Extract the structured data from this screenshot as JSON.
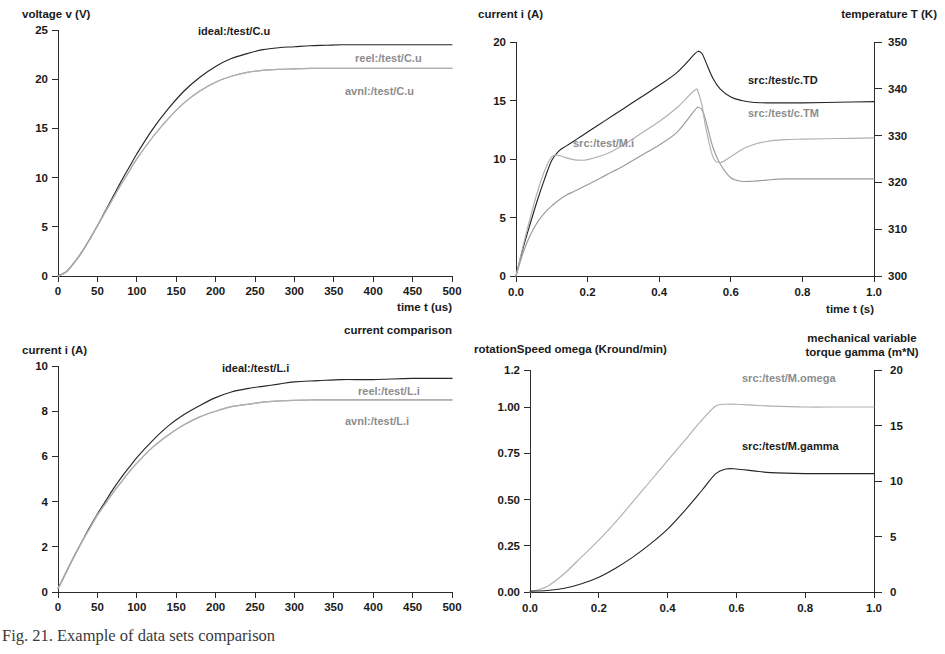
{
  "figure": {
    "caption": "Fig. 21. Example of data sets comparison"
  },
  "panels": {
    "top_left": {
      "name": "capacitor voltage",
      "y_axis_title": "voltage v (V)",
      "x_axis_title": "time t (us)",
      "y_ticks": [
        "0",
        "5",
        "10",
        "15",
        "20",
        "25"
      ],
      "x_ticks": [
        "0",
        "50",
        "100",
        "150",
        "200",
        "250",
        "300",
        "350",
        "400",
        "450",
        "500"
      ],
      "labels": {
        "ideal": "ideal:/test/C.u",
        "reel": "reel:/test/C.u",
        "avnl": "avnl:/test/C.u"
      }
    },
    "top_right": {
      "name": "motor current and temperature",
      "y_axis_title": "current i (A)",
      "y2_axis_title": "temperature T (K)",
      "x_axis_title": "time t (s)",
      "y_ticks": [
        "0",
        "5",
        "10",
        "15",
        "20"
      ],
      "y2_ticks": [
        "300",
        "310",
        "320",
        "330",
        "340",
        "350"
      ],
      "x_ticks": [
        "0.0",
        "0.2",
        "0.4",
        "0.6",
        "0.8",
        "1.0"
      ],
      "labels": {
        "td": "src:/test/c.TD",
        "tm": "src:/test/c.TM",
        "mi": "src:/test/M.i"
      }
    },
    "bottom_left": {
      "name": "inductor current comparison",
      "title": "current comparison",
      "y_axis_title": "current i (A)",
      "x_axis_title": "time t (us)",
      "y_ticks": [
        "0",
        "2",
        "4",
        "6",
        "8",
        "10"
      ],
      "x_ticks": [
        "0",
        "50",
        "100",
        "150",
        "200",
        "250",
        "300",
        "350",
        "400",
        "450",
        "500"
      ],
      "labels": {
        "ideal": "ideal:/test/L.i",
        "reel": "reel:/test/L.i",
        "avnl": "avnl:/test/L.i"
      }
    },
    "bottom_right": {
      "name": "rotation speed and torque",
      "y_axis_title": "rotationSpeed omega (Kround/min)",
      "y2_axis_title_line1": "mechanical variable",
      "y2_axis_title_line2": "torque gamma (m*N)",
      "x_axis_title": "time t (s)",
      "y_ticks": [
        "0.00",
        "0.25",
        "0.50",
        "0.75",
        "1.00",
        "1.2"
      ],
      "y2_ticks": [
        "0",
        "5",
        "10",
        "15",
        "20"
      ],
      "x_ticks": [
        "0.0",
        "0.2",
        "0.4",
        "0.6",
        "0.8",
        "1.0"
      ],
      "labels": {
        "omega": "src:/test/M.omega",
        "gamma": "src:/test/M.gamma"
      }
    }
  },
  "colors": {
    "curve_dark": "#262626",
    "curve_grey": "#9a9a9a",
    "curve_grey_light": "#b0b0b0",
    "axis": "#2b2b2b",
    "text": "#1a1a1a"
  },
  "chart_data": [
    {
      "id": "top_left",
      "type": "line",
      "title": "",
      "xlabel": "time t (us)",
      "ylabel": "voltage v (V)",
      "xlim": [
        0,
        500
      ],
      "ylim": [
        0,
        25
      ],
      "grid": false,
      "legend": "inline-annotations",
      "x": [
        0,
        10,
        20,
        30,
        40,
        50,
        60,
        70,
        80,
        90,
        100,
        120,
        140,
        160,
        180,
        200,
        220,
        240,
        260,
        280,
        300,
        320,
        340,
        360,
        380,
        400,
        430,
        460,
        500
      ],
      "series": [
        {
          "name": "ideal:/test/C.u",
          "color": "#262626",
          "values": [
            0,
            0.4,
            1.3,
            2.4,
            3.7,
            5.1,
            6.6,
            8.1,
            9.6,
            11.0,
            12.4,
            14.9,
            17.0,
            18.8,
            20.2,
            21.3,
            22.1,
            22.6,
            23.0,
            23.2,
            23.3,
            23.4,
            23.45,
            23.5,
            23.5,
            23.5,
            23.5,
            23.5,
            23.5
          ]
        },
        {
          "name": "reel:/test/C.u",
          "color": "#9a9a9a",
          "values": [
            0,
            0.4,
            1.3,
            2.4,
            3.7,
            5.1,
            6.5,
            7.9,
            9.3,
            10.6,
            11.9,
            14.1,
            16.0,
            17.6,
            18.8,
            19.7,
            20.3,
            20.7,
            20.9,
            21.0,
            21.05,
            21.1,
            21.1,
            21.1,
            21.1,
            21.1,
            21.1,
            21.1,
            21.1
          ]
        },
        {
          "name": "avnl:/test/C.u",
          "color": "#b0b0b0",
          "values": [
            0,
            0.4,
            1.3,
            2.4,
            3.7,
            5.1,
            6.5,
            7.9,
            9.3,
            10.6,
            11.9,
            14.1,
            16.0,
            17.6,
            18.8,
            19.7,
            20.3,
            20.7,
            20.9,
            21.0,
            21.05,
            21.1,
            21.1,
            21.1,
            21.1,
            21.1,
            21.1,
            21.1,
            21.1
          ]
        }
      ]
    },
    {
      "id": "top_right",
      "type": "line",
      "title": "",
      "xlabel": "time t (s)",
      "ylabel": "current i (A)",
      "y2label": "temperature T (K)",
      "xlim": [
        0,
        1.0
      ],
      "ylim": [
        0,
        20
      ],
      "y2lim": [
        300,
        350
      ],
      "grid": false,
      "legend": "inline-annotations",
      "x": [
        0.0,
        0.02,
        0.04,
        0.06,
        0.08,
        0.1,
        0.12,
        0.14,
        0.16,
        0.18,
        0.2,
        0.25,
        0.3,
        0.35,
        0.4,
        0.45,
        0.5,
        0.51,
        0.52,
        0.53,
        0.55,
        0.57,
        0.6,
        0.63,
        0.66,
        0.7,
        0.75,
        0.8,
        0.9,
        1.0
      ],
      "series": [
        {
          "name": "src:/test/c.TD",
          "color": "#262626",
          "axis": "right",
          "values": [
            0,
            2.4,
            4.5,
            6.5,
            8.3,
            9.9,
            10.7,
            11.1,
            11.5,
            11.9,
            12.3,
            13.3,
            14.3,
            15.3,
            16.3,
            17.4,
            19.0,
            19.2,
            19.0,
            18.3,
            16.9,
            16.0,
            15.3,
            15.0,
            14.85,
            14.8,
            14.8,
            14.8,
            14.85,
            14.9
          ]
        },
        {
          "name": "src:/test/c.TM",
          "color": "#9a9a9a",
          "axis": "right",
          "values": [
            0,
            2.0,
            3.5,
            4.6,
            5.4,
            6.0,
            6.5,
            6.9,
            7.2,
            7.5,
            7.8,
            8.6,
            9.4,
            10.3,
            11.2,
            12.3,
            14.2,
            14.4,
            14.2,
            13.3,
            11.0,
            9.6,
            8.4,
            8.1,
            8.1,
            8.2,
            8.3,
            8.3,
            8.3,
            8.3
          ]
        },
        {
          "name": "src:/test/M.i",
          "color": "#b0b0b0",
          "axis": "left",
          "values": [
            0,
            2.6,
            5.0,
            7.2,
            9.0,
            10.2,
            10.3,
            10.1,
            9.95,
            9.9,
            9.95,
            10.4,
            11.2,
            12.2,
            13.2,
            14.4,
            15.9,
            15.6,
            14.5,
            12.7,
            10.2,
            9.7,
            10.2,
            10.8,
            11.2,
            11.5,
            11.65,
            11.7,
            11.75,
            11.8
          ]
        }
      ]
    },
    {
      "id": "bottom_left",
      "type": "line",
      "title": "current comparison",
      "xlabel": "time t (us)",
      "ylabel": "current i (A)",
      "xlim": [
        0,
        500
      ],
      "ylim": [
        0,
        10
      ],
      "grid": false,
      "legend": "inline-annotations",
      "x": [
        0,
        10,
        20,
        30,
        40,
        50,
        60,
        70,
        80,
        90,
        100,
        120,
        140,
        160,
        180,
        200,
        220,
        240,
        260,
        280,
        300,
        330,
        360,
        400,
        450,
        500
      ],
      "series": [
        {
          "name": "ideal:/test/L.i",
          "color": "#262626",
          "values": [
            0.15,
            0.85,
            1.55,
            2.2,
            2.85,
            3.45,
            4.0,
            4.55,
            5.05,
            5.5,
            5.95,
            6.7,
            7.35,
            7.85,
            8.25,
            8.6,
            8.85,
            9.0,
            9.1,
            9.2,
            9.3,
            9.35,
            9.4,
            9.4,
            9.45,
            9.45
          ]
        },
        {
          "name": "reel:/test/L.i",
          "color": "#9a9a9a",
          "values": [
            0.15,
            0.85,
            1.55,
            2.2,
            2.8,
            3.4,
            3.9,
            4.4,
            4.85,
            5.3,
            5.7,
            6.4,
            6.95,
            7.4,
            7.75,
            8.0,
            8.2,
            8.3,
            8.4,
            8.45,
            8.48,
            8.5,
            8.5,
            8.5,
            8.5,
            8.5
          ]
        },
        {
          "name": "avnl:/test/L.i",
          "color": "#b0b0b0",
          "values": [
            0.15,
            0.85,
            1.55,
            2.2,
            2.8,
            3.4,
            3.9,
            4.4,
            4.85,
            5.3,
            5.7,
            6.4,
            6.95,
            7.4,
            7.75,
            8.0,
            8.2,
            8.3,
            8.4,
            8.45,
            8.48,
            8.5,
            8.5,
            8.5,
            8.5,
            8.5
          ]
        }
      ]
    },
    {
      "id": "bottom_right",
      "type": "line",
      "title": "",
      "xlabel": "time t (s)",
      "ylabel": "rotationSpeed omega (Kround/min)",
      "y2label": "mechanical variable torque gamma (m*N)",
      "xlim": [
        0,
        1.0
      ],
      "ylim": [
        0,
        1.2
      ],
      "y2lim": [
        0,
        20
      ],
      "grid": false,
      "legend": "inline-annotations",
      "x": [
        0.0,
        0.05,
        0.1,
        0.15,
        0.2,
        0.25,
        0.3,
        0.35,
        0.4,
        0.45,
        0.5,
        0.54,
        0.57,
        0.6,
        0.65,
        0.7,
        0.8,
        0.9,
        1.0
      ],
      "series": [
        {
          "name": "src:/test/M.omega",
          "color": "#b0b0b0",
          "axis": "left",
          "values": [
            0.0,
            0.03,
            0.1,
            0.19,
            0.28,
            0.38,
            0.49,
            0.6,
            0.71,
            0.82,
            0.93,
            1.005,
            1.015,
            1.015,
            1.01,
            1.005,
            1.0,
            1.0,
            1.0
          ]
        },
        {
          "name": "src:/test/M.gamma",
          "color": "#262626",
          "axis": "left",
          "values": [
            0.005,
            0.008,
            0.02,
            0.045,
            0.08,
            0.13,
            0.19,
            0.26,
            0.34,
            0.44,
            0.55,
            0.64,
            0.665,
            0.665,
            0.655,
            0.645,
            0.64,
            0.64,
            0.64
          ]
        }
      ]
    }
  ]
}
